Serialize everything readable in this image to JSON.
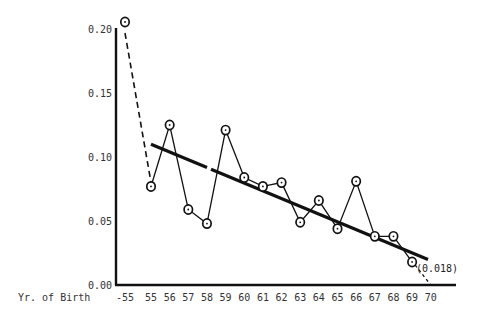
{
  "chart_data": {
    "type": "line",
    "title": "",
    "xlabel": "Yr. of Birth",
    "ylabel": "",
    "ylim": [
      0.0,
      0.2
    ],
    "grid": false,
    "y_ticks": [
      "0.00",
      "0.05",
      "0.10",
      "0.15",
      "0.20"
    ],
    "x_ticks": [
      "-55",
      "55",
      "56",
      "57",
      "58",
      "59",
      "60",
      "61",
      "62",
      "63",
      "64",
      "65",
      "66",
      "67",
      "68",
      "69",
      "70"
    ],
    "series": [
      {
        "name": "observed",
        "style": "solid line with circle markers",
        "x": [
          "55",
          "56",
          "57",
          "58",
          "59",
          "60",
          "61",
          "62",
          "63",
          "64",
          "65",
          "66",
          "67",
          "68",
          "69"
        ],
        "values": [
          0.077,
          0.125,
          0.059,
          0.048,
          0.121,
          0.084,
          0.077,
          0.08,
          0.049,
          0.066,
          0.044,
          0.081,
          0.038,
          0.038,
          0.018
        ]
      },
      {
        "name": "pre-1955 cohort",
        "style": "dashed connector",
        "x": [
          "-55",
          "55"
        ],
        "values": [
          0.2,
          0.077
        ]
      },
      {
        "name": "extrapolation",
        "style": "dotted connector",
        "x": [
          "69",
          "70"
        ],
        "values": [
          0.018,
          0.0
        ]
      },
      {
        "name": "trend",
        "style": "thick solid line",
        "x": [
          "55",
          "69.9"
        ],
        "values": [
          0.11,
          0.02
        ]
      }
    ],
    "annotations": [
      {
        "text": "(0.018)",
        "x": "69",
        "y": 0.018
      }
    ]
  },
  "labels": {
    "xlabel": "Yr. of Birth",
    "annotation": "(0.018)"
  }
}
